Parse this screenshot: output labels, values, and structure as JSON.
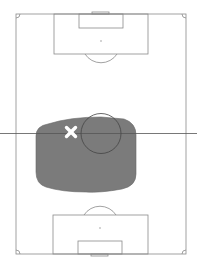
{
  "pitch": {
    "orientation": "vertical",
    "line_color": "#8a8a8a",
    "background": "#ffffff"
  },
  "heatmap_zone": {
    "label": "activity-zone",
    "fill": "#7a7a7a",
    "opacity": 0.9
  },
  "marker": {
    "type": "cross",
    "color": "#ffffff",
    "x": 71,
    "y": 132
  }
}
